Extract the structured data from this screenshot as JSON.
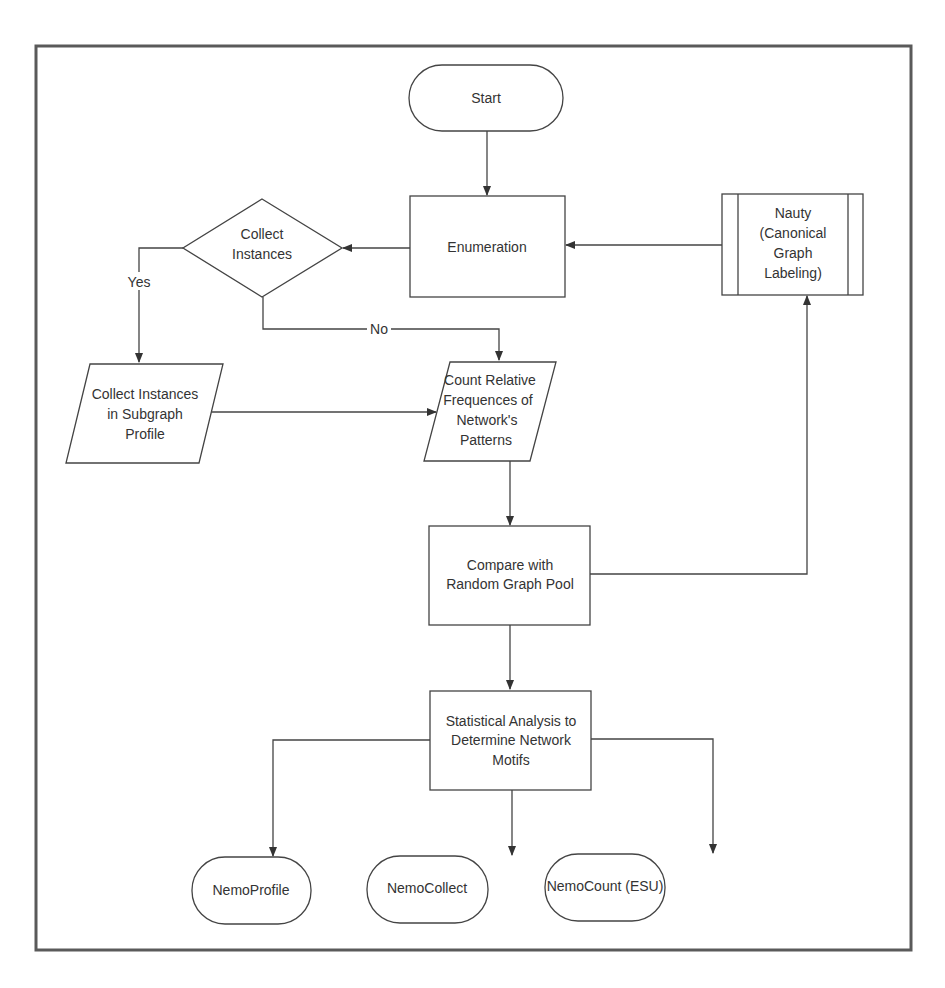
{
  "diagram": {
    "type": "flowchart",
    "nodes": {
      "start": {
        "shape": "terminal",
        "lines": [
          "Start"
        ]
      },
      "enumeration": {
        "shape": "process",
        "lines": [
          "Enumeration"
        ]
      },
      "nauty": {
        "shape": "predefined-process",
        "lines": [
          "Nauty",
          "(Canonical",
          "Graph",
          "Labeling)"
        ]
      },
      "collect_decision": {
        "shape": "decision",
        "lines": [
          "Collect",
          "Instances"
        ]
      },
      "collect_instances": {
        "shape": "data",
        "lines": [
          "Collect Instances",
          "in Subgraph",
          "Profile"
        ]
      },
      "count_relative": {
        "shape": "data",
        "lines": [
          "Count Relative",
          "Frequences of",
          "Network's",
          "Patterns"
        ]
      },
      "compare": {
        "shape": "process",
        "lines": [
          "Compare with",
          "Random Graph Pool"
        ]
      },
      "statistical": {
        "shape": "process",
        "lines": [
          "Statistical Analysis to",
          "Determine Network",
          "Motifs"
        ]
      },
      "nemo_profile": {
        "shape": "terminal",
        "lines": [
          "NemoProfile"
        ]
      },
      "nemo_collect": {
        "shape": "terminal",
        "lines": [
          "NemoCollect"
        ]
      },
      "nemo_count": {
        "shape": "terminal",
        "lines": [
          "NemoCount (ESU)"
        ]
      }
    },
    "edges": [
      {
        "from": "start",
        "to": "enumeration",
        "label": ""
      },
      {
        "from": "nauty",
        "to": "enumeration",
        "label": ""
      },
      {
        "from": "enumeration",
        "to": "collect_decision",
        "label": ""
      },
      {
        "from": "collect_decision",
        "to": "collect_instances",
        "label": "Yes"
      },
      {
        "from": "collect_decision",
        "to": "count_relative",
        "label": "No"
      },
      {
        "from": "collect_instances",
        "to": "count_relative",
        "label": ""
      },
      {
        "from": "count_relative",
        "to": "compare",
        "label": ""
      },
      {
        "from": "compare",
        "to": "nauty",
        "label": ""
      },
      {
        "from": "compare",
        "to": "statistical",
        "label": ""
      },
      {
        "from": "statistical",
        "to": "nemo_profile",
        "label": ""
      },
      {
        "from": "statistical",
        "to": "nemo_collect",
        "label": ""
      },
      {
        "from": "statistical",
        "to": "nemo_count",
        "label": ""
      }
    ],
    "edge_labels": {
      "yes": "Yes",
      "no": "No"
    },
    "colors": {
      "stroke": "#444444",
      "frame": "#5a5a5a",
      "text": "#333333",
      "background": "#ffffff"
    }
  }
}
